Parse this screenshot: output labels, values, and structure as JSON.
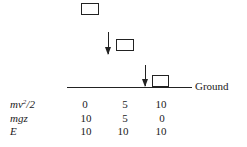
{
  "diagram": {
    "ground_label": "Ground",
    "boxes": [
      {
        "name": "block-start",
        "x": 81,
        "y": 3,
        "w": 18,
        "h": 12
      },
      {
        "name": "block-mid",
        "x": 116,
        "y": 39,
        "w": 18,
        "h": 12
      },
      {
        "name": "block-ground",
        "x": 152,
        "y": 75,
        "w": 17,
        "h": 12
      }
    ],
    "arrows": [
      {
        "name": "velocity-arrow-mid",
        "x": 108,
        "y": 32,
        "len": 24
      },
      {
        "name": "velocity-arrow-ground",
        "x": 145,
        "y": 66,
        "len": 22
      }
    ]
  },
  "table": {
    "rows": [
      {
        "label_main": "mv",
        "label_sup": "2",
        "label_tail": "/2",
        "values": [
          "0",
          "5",
          "10"
        ]
      },
      {
        "label": "mgz",
        "values": [
          "10",
          "5",
          "0"
        ]
      },
      {
        "label": "E",
        "values": [
          "10",
          "10",
          "10"
        ]
      }
    ]
  }
}
